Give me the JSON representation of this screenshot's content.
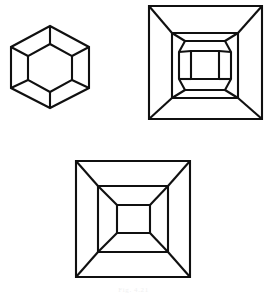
{
  "page": {
    "background_color": "#ffffff",
    "ink_color": "#101010",
    "width": 267,
    "height": 295
  },
  "caption": {
    "text": "Fig. 4.21",
    "visible": false,
    "color": "#c9c9c9",
    "left": 0,
    "top": 286,
    "font_size": 7
  },
  "figures": [
    {
      "id": "hexagon-nested",
      "name": "nested-hexagon-figure",
      "label": "Nested hexagon with radial spokes",
      "stroke_width": 2.1,
      "outer": {
        "shape": "hexagon",
        "points": "50,26 89,47 89,88 50,108 11,88 11,47"
      },
      "inner": {
        "shape": "hexagon",
        "points": "50,44 72,56 72,80 50,92 28,80 28,56"
      },
      "spokes": [
        {
          "x1": 50,
          "y1": 26,
          "x2": 50,
          "y2": 44
        },
        {
          "x1": 89,
          "y1": 47,
          "x2": 72,
          "y2": 56
        },
        {
          "x1": 89,
          "y1": 88,
          "x2": 72,
          "y2": 80
        },
        {
          "x1": 50,
          "y1": 108,
          "x2": 50,
          "y2": 92
        },
        {
          "x1": 11,
          "y1": 88,
          "x2": 28,
          "y2": 80
        },
        {
          "x1": 11,
          "y1": 47,
          "x2": 28,
          "y2": 56
        }
      ]
    },
    {
      "id": "square-octagon-nested",
      "name": "square-octagon-figure",
      "label": "Square with inset square, octagon and central square",
      "stroke_width": 2.1,
      "outer": {
        "shape": "square",
        "points": "149,6 262,6 262,119 149,119"
      },
      "middle": {
        "shape": "square",
        "points": "172,33 238,33 238,98 172,98"
      },
      "outer_diagonals": [
        {
          "x1": 149,
          "y1": 6,
          "x2": 172,
          "y2": 33
        },
        {
          "x1": 262,
          "y1": 6,
          "x2": 238,
          "y2": 33
        },
        {
          "x1": 262,
          "y1": 119,
          "x2": 238,
          "y2": 98
        },
        {
          "x1": 149,
          "y1": 119,
          "x2": 172,
          "y2": 98
        }
      ],
      "octagon": {
        "shape": "octagon",
        "points": "185,41 225,41 231,52 231,79 225,90 185,90 179,79 179,52"
      },
      "inner": {
        "shape": "square",
        "points": "191,51 219,51 219,79 191,79"
      },
      "octagon_diagonals": [
        {
          "x1": 172,
          "y1": 33,
          "x2": 185,
          "y2": 41
        },
        {
          "x1": 238,
          "y1": 33,
          "x2": 225,
          "y2": 41
        },
        {
          "x1": 238,
          "y1": 98,
          "x2": 225,
          "y2": 90
        },
        {
          "x1": 172,
          "y1": 98,
          "x2": 185,
          "y2": 90
        },
        {
          "x1": 179,
          "y1": 52,
          "x2": 191,
          "y2": 51
        },
        {
          "x1": 231,
          "y1": 52,
          "x2": 219,
          "y2": 51
        },
        {
          "x1": 231,
          "y1": 79,
          "x2": 219,
          "y2": 79
        },
        {
          "x1": 179,
          "y1": 79,
          "x2": 191,
          "y2": 79
        }
      ]
    },
    {
      "id": "square-tunnel-nested",
      "name": "nested-square-figure",
      "label": "Square within square within square, corner diagonals",
      "stroke_width": 2.1,
      "outer": {
        "shape": "square",
        "points": "76,161 190,161 190,277 76,277"
      },
      "middle": {
        "shape": "square",
        "points": "98,186 168,186 168,252 98,252"
      },
      "inner": {
        "shape": "square",
        "points": "117,205 150,205 150,233 117,233"
      },
      "outer_diagonals": [
        {
          "x1": 76,
          "y1": 161,
          "x2": 98,
          "y2": 186
        },
        {
          "x1": 190,
          "y1": 161,
          "x2": 168,
          "y2": 186
        },
        {
          "x1": 190,
          "y1": 277,
          "x2": 168,
          "y2": 252
        },
        {
          "x1": 76,
          "y1": 277,
          "x2": 98,
          "y2": 252
        }
      ],
      "inner_diagonals": [
        {
          "x1": 98,
          "y1": 186,
          "x2": 117,
          "y2": 205
        },
        {
          "x1": 168,
          "y1": 186,
          "x2": 150,
          "y2": 205
        },
        {
          "x1": 168,
          "y1": 252,
          "x2": 150,
          "y2": 233
        },
        {
          "x1": 98,
          "y1": 252,
          "x2": 117,
          "y2": 233
        }
      ]
    }
  ]
}
